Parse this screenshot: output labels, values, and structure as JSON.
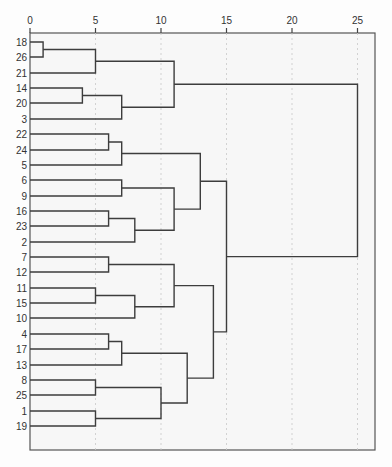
{
  "chart_data": {
    "type": "dendrogram",
    "title": "",
    "xlabel": "",
    "ylabel": "",
    "orientation": "horizontal",
    "xlim": [
      0,
      25
    ],
    "x_ticks": [
      0,
      5,
      10,
      15,
      20,
      25
    ],
    "grid": true,
    "leaf_order": [
      "18",
      "26",
      "21",
      "14",
      "20",
      "3",
      "22",
      "24",
      "5",
      "6",
      "9",
      "16",
      "23",
      "2",
      "7",
      "12",
      "11",
      "15",
      "10",
      "4",
      "17",
      "13",
      "8",
      "25",
      "1",
      "19"
    ],
    "leaves_shown": [
      "18",
      "26",
      "21",
      "14",
      "20",
      "3",
      "22",
      "24",
      "5",
      "6",
      "9",
      "16",
      "23",
      "2",
      "7",
      "12",
      "11",
      "15",
      "10",
      "4",
      "17",
      "13",
      "8",
      "25",
      "1",
      "19"
    ],
    "merges": [
      {
        "id": "m1",
        "children": [
          "18",
          "26"
        ],
        "height": 1
      },
      {
        "id": "m2",
        "children": [
          "m1",
          "21"
        ],
        "height": 5
      },
      {
        "id": "m3",
        "children": [
          "14",
          "20"
        ],
        "height": 4
      },
      {
        "id": "m4",
        "children": [
          "m3",
          "3"
        ],
        "height": 7
      },
      {
        "id": "m5",
        "children": [
          "m2",
          "m4"
        ],
        "height": 11
      },
      {
        "id": "m6",
        "children": [
          "22",
          "24"
        ],
        "height": 6
      },
      {
        "id": "m7",
        "children": [
          "m6",
          "5"
        ],
        "height": 7
      },
      {
        "id": "m8",
        "children": [
          "6",
          "9"
        ],
        "height": 7
      },
      {
        "id": "m9",
        "children": [
          "16",
          "23"
        ],
        "height": 6
      },
      {
        "id": "m10",
        "children": [
          "m9",
          "2"
        ],
        "height": 8
      },
      {
        "id": "m11",
        "children": [
          "m8",
          "m10"
        ],
        "height": 11
      },
      {
        "id": "m12",
        "children": [
          "m7",
          "m11"
        ],
        "height": 13
      },
      {
        "id": "m13",
        "children": [
          "7",
          "12"
        ],
        "height": 6
      },
      {
        "id": "m14",
        "children": [
          "11",
          "15"
        ],
        "height": 5
      },
      {
        "id": "m15",
        "children": [
          "m14",
          "10"
        ],
        "height": 8
      },
      {
        "id": "m16",
        "children": [
          "m13",
          "m15"
        ],
        "height": 11
      },
      {
        "id": "m17",
        "children": [
          "4",
          "17"
        ],
        "height": 6
      },
      {
        "id": "m18",
        "children": [
          "m17",
          "13"
        ],
        "height": 7
      },
      {
        "id": "m19",
        "children": [
          "8",
          "25"
        ],
        "height": 5
      },
      {
        "id": "m20",
        "children": [
          "1",
          "19"
        ],
        "height": 5
      },
      {
        "id": "m21",
        "children": [
          "m19",
          "m20"
        ],
        "height": 10
      },
      {
        "id": "m22",
        "children": [
          "m18",
          "m21"
        ],
        "height": 12
      },
      {
        "id": "m23",
        "children": [
          "m16",
          "m22"
        ],
        "height": 14
      },
      {
        "id": "m24",
        "children": [
          "m12",
          "m23"
        ],
        "height": 15
      },
      {
        "id": "m25",
        "children": [
          "m5",
          "m24"
        ],
        "height": 25
      }
    ]
  },
  "layout": {
    "x0_px": 30,
    "px_per_unit": 13.1,
    "axis_y_px": 33,
    "first_leaf_y_px": 42,
    "leaf_spacing_px": 15.36,
    "frame_right_px": 375,
    "frame_bottom_px": 450,
    "colors": {
      "link": "#3d3d3d",
      "frame": "#555555",
      "text": "#333333",
      "grid": "#c8c8c8"
    }
  }
}
